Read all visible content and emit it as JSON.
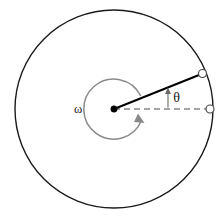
{
  "figure": {
    "background_color": "#ffffff",
    "width": 224,
    "height": 219
  },
  "geometry": {
    "center": {
      "x": 114,
      "y": 109
    },
    "outer_radius": 99,
    "inner_arc_radius": 30,
    "radius_line_angle_deg": 22,
    "rim_marker_radius": 4
  },
  "colors": {
    "outline": "#1a1a1a",
    "radius_line": "#000000",
    "dashed_reference": "#4a4a4a",
    "omega_arc": "#8a8a8a",
    "theta_arrow": "#6a6a6a",
    "marker_fill": "#ffffff",
    "center_dot": "#000000"
  },
  "labels": {
    "omega": "ω",
    "theta": "θ"
  },
  "elements": {
    "outer_circle_name": "disk-outer-circle",
    "center_point_name": "center-point",
    "radius_line_name": "radius-line",
    "reference_line_name": "horizontal-reference-dashed-line",
    "omega_arc_name": "angular-velocity-arc-arrow",
    "theta_arrow_name": "theta-angle-arrow",
    "rim_marker_rotated_name": "rim-marker-rotated",
    "rim_marker_reference_name": "rim-marker-reference"
  }
}
